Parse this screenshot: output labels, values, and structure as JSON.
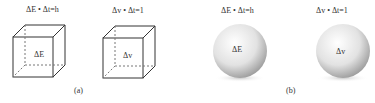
{
  "panel_a": {
    "caption": "(a)",
    "cube1": {
      "top_label": "ΔE • Δt=h",
      "inner_label": "ΔE"
    },
    "cube2": {
      "top_label": "Δv • Δt=1",
      "inner_label": "Δv"
    }
  },
  "panel_b": {
    "caption": "(b)",
    "sphere1": {
      "top_label": "ΔE • Δt=h",
      "inner_label": "ΔE"
    },
    "sphere2": {
      "top_label": "Δv • Δt=1",
      "inner_label": "Δv"
    }
  }
}
